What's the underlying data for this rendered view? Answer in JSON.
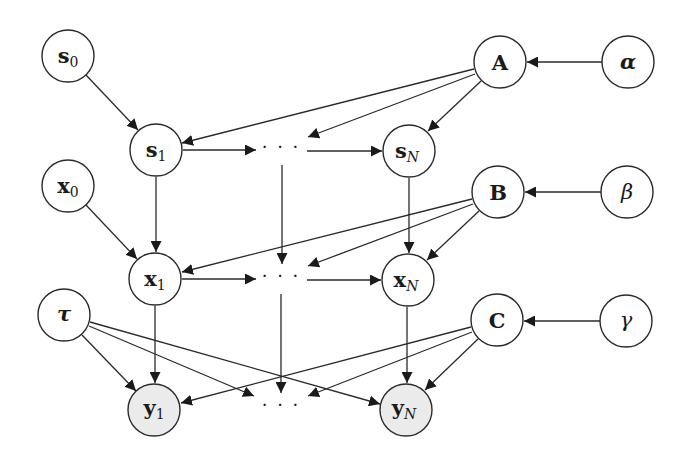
{
  "diagram": {
    "type": "graphical-model",
    "nodes": [
      {
        "id": "s0",
        "base": "s",
        "sub": "0",
        "observed": false
      },
      {
        "id": "s1",
        "base": "s",
        "sub": "1",
        "observed": false
      },
      {
        "id": "s_dots",
        "label": "· · ·"
      },
      {
        "id": "sN",
        "base": "s",
        "sub": "N",
        "observed": false
      },
      {
        "id": "A",
        "label": "A",
        "observed": false
      },
      {
        "id": "alpha",
        "label": "α",
        "observed": false
      },
      {
        "id": "x0",
        "base": "x",
        "sub": "0",
        "observed": false
      },
      {
        "id": "x1",
        "base": "x",
        "sub": "1",
        "observed": false
      },
      {
        "id": "x_dots",
        "label": "· · ·"
      },
      {
        "id": "xN",
        "base": "x",
        "sub": "N",
        "observed": false
      },
      {
        "id": "B",
        "label": "B",
        "observed": false
      },
      {
        "id": "beta",
        "label": "β",
        "observed": false
      },
      {
        "id": "tau",
        "label": "τ",
        "observed": false
      },
      {
        "id": "y1",
        "base": "y",
        "sub": "1",
        "observed": true
      },
      {
        "id": "y_dots",
        "label": "· · ·"
      },
      {
        "id": "yN",
        "base": "y",
        "sub": "N",
        "observed": true
      },
      {
        "id": "C",
        "label": "C",
        "observed": false
      },
      {
        "id": "gamma",
        "label": "γ",
        "observed": false
      }
    ],
    "edges": [
      [
        "s0",
        "s1"
      ],
      [
        "s1",
        "s_dots"
      ],
      [
        "s_dots",
        "sN"
      ],
      [
        "A",
        "s1"
      ],
      [
        "A",
        "s_dots"
      ],
      [
        "A",
        "sN"
      ],
      [
        "alpha",
        "A"
      ],
      [
        "x0",
        "x1"
      ],
      [
        "x1",
        "x_dots"
      ],
      [
        "x_dots",
        "xN"
      ],
      [
        "s1",
        "x1"
      ],
      [
        "s_dots",
        "x_dots"
      ],
      [
        "sN",
        "xN"
      ],
      [
        "B",
        "x1"
      ],
      [
        "B",
        "x_dots"
      ],
      [
        "B",
        "xN"
      ],
      [
        "beta",
        "B"
      ],
      [
        "x1",
        "y1"
      ],
      [
        "x_dots",
        "y_dots"
      ],
      [
        "xN",
        "yN"
      ],
      [
        "tau",
        "y1"
      ],
      [
        "tau",
        "y_dots"
      ],
      [
        "tau",
        "yN"
      ],
      [
        "C",
        "y1"
      ],
      [
        "C",
        "y_dots"
      ],
      [
        "C",
        "yN"
      ],
      [
        "gamma",
        "C"
      ]
    ]
  },
  "labels": {
    "s0": {
      "base": "s",
      "sub": "0"
    },
    "s1": {
      "base": "s",
      "sub": "1"
    },
    "sN": {
      "base": "s",
      "sub": "N"
    },
    "x0": {
      "base": "x",
      "sub": "0"
    },
    "x1": {
      "base": "x",
      "sub": "1"
    },
    "xN": {
      "base": "x",
      "sub": "N"
    },
    "y1": {
      "base": "y",
      "sub": "1"
    },
    "yN": {
      "base": "y",
      "sub": "N"
    },
    "A": "A",
    "B": "B",
    "C": "C",
    "alpha": "α",
    "beta": "β",
    "gamma": "γ",
    "tau": "τ",
    "dots": "· · ·"
  }
}
